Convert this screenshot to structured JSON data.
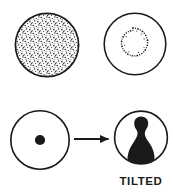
{
  "figure": {
    "title": "",
    "background_color": "#ffffff",
    "ink_color": "#1a1a1a",
    "width": 173,
    "height": 196
  },
  "panels": [
    {
      "id": "top-left",
      "name": "stippled-disc",
      "description": "Circle filled uniformly with dense stipple dots",
      "circle": {
        "cx": 47,
        "cy": 45,
        "r": 32
      },
      "stroke_width": 1.6,
      "fill_pattern": "dense-stipple",
      "label": ""
    },
    {
      "id": "top-right",
      "name": "dotted-ring-circle",
      "description": "Empty circle containing a small central ring of stipple dots",
      "circle": {
        "cx": 135,
        "cy": 44,
        "r": 31
      },
      "stroke_width": 1.6,
      "inner_ring": {
        "cx": 133,
        "cy": 42,
        "r": 14,
        "dot_count": 34
      },
      "label": ""
    },
    {
      "id": "bottom-left",
      "name": "centered-dot-circle",
      "description": "Empty circle with a solid black dot at its centre",
      "circle": {
        "cx": 40,
        "cy": 140,
        "r": 29.5
      },
      "stroke_width": 1.6,
      "center_dot": {
        "cx": 40,
        "cy": 140,
        "r": 5
      },
      "label": ""
    },
    {
      "id": "bottom-right",
      "name": "tilted-blob-circle",
      "description": "Circle containing a solid black bust-shaped blob that widens to the bottom rim",
      "circle": {
        "cx": 141,
        "cy": 137.5,
        "r": 27
      },
      "stroke_width": 1.6,
      "label": "TILTED"
    }
  ],
  "arrow": {
    "name": "transition-arrow",
    "direction": "right",
    "x1": 74,
    "x2": 111,
    "y": 139,
    "stroke_width": 1.7,
    "head_length": 9,
    "head_width": 8
  },
  "labels": {
    "tilted": "TILTED"
  }
}
